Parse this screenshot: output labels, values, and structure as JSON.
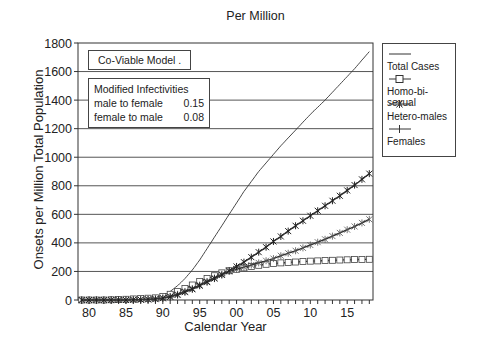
{
  "chart_data": {
    "type": "line",
    "title": "Per Million",
    "xlabel": "Calendar Year",
    "ylabel": "Onsets per Million Total Population",
    "xlim": [
      1978.5,
      2018.5
    ],
    "ylim": [
      0,
      1800
    ],
    "y_ticks": [
      0,
      200,
      400,
      600,
      800,
      1000,
      1200,
      1400,
      1600,
      1800
    ],
    "x_tick_labels": [
      "80",
      "85",
      "90",
      "95",
      "00",
      "05",
      "10",
      "15"
    ],
    "x_tick_values": [
      1980,
      1985,
      1990,
      1995,
      2000,
      2005,
      2010,
      2015
    ],
    "grid": "horizontal",
    "legend_position": "right, outside",
    "x": [
      1979,
      1982,
      1985,
      1987,
      1989,
      1990,
      1991,
      1992,
      1993,
      1994,
      1995,
      1996,
      1997,
      1998,
      1999,
      2000,
      2001,
      2002,
      2003,
      2004,
      2005,
      2006,
      2008,
      2010,
      2012,
      2014,
      2016,
      2018
    ],
    "series": [
      {
        "name": "Total Cases",
        "marker": "none",
        "values": [
          0,
          0,
          0,
          5,
          15,
          30,
          60,
          100,
          150,
          210,
          280,
          360,
          440,
          520,
          600,
          680,
          760,
          830,
          900,
          960,
          1020,
          1080,
          1190,
          1300,
          1400,
          1510,
          1620,
          1740
        ]
      },
      {
        "name": "Homo-bi-sexual",
        "marker": "square",
        "values": [
          0,
          0,
          5,
          10,
          15,
          25,
          40,
          60,
          80,
          105,
          130,
          150,
          170,
          190,
          205,
          215,
          225,
          235,
          243,
          250,
          255,
          260,
          266,
          272,
          276,
          280,
          283,
          285
        ]
      },
      {
        "name": "Hetero-males",
        "marker": "asterisk",
        "values": [
          0,
          0,
          0,
          2,
          8,
          15,
          25,
          40,
          60,
          80,
          105,
          130,
          155,
          180,
          200,
          215,
          230,
          245,
          260,
          275,
          290,
          310,
          345,
          385,
          425,
          470,
          515,
          565
        ]
      },
      {
        "name": "Females",
        "marker": "plus",
        "values": [
          0,
          0,
          0,
          2,
          6,
          12,
          22,
          35,
          55,
          75,
          100,
          125,
          150,
          175,
          205,
          235,
          265,
          300,
          335,
          370,
          410,
          445,
          520,
          590,
          660,
          730,
          805,
          885
        ]
      }
    ],
    "annotations": [
      "Co-Viable Model .",
      "Modified Infectivities",
      "male to female 0.15",
      "female to male 0.08"
    ]
  },
  "title": "Per Million",
  "xlabel": "Calendar Year",
  "ylabel": "Onsets per Million Total Population",
  "model_box": "Co-Viable Model .",
  "infectivity": {
    "heading": "Modified Infectivities",
    "rows": [
      {
        "label": "male to female",
        "value": "0.15"
      },
      {
        "label": "female to male",
        "value": "0.08"
      }
    ]
  },
  "legend": [
    "Total Cases",
    "Homo-bi-sexual",
    "Hetero-males",
    "Females"
  ]
}
